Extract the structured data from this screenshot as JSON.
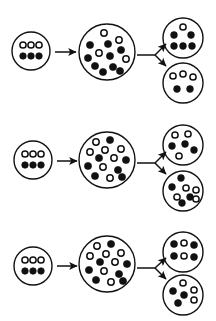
{
  "figure": {
    "name": "population-bottleneck-drift-diagram",
    "type": "diagram",
    "background_color": "#ffffff",
    "stroke_color": "#111111",
    "allele_types": {
      "filled": "filled-allele-dot",
      "open": "open-allele-dot"
    },
    "width": 216,
    "height": 321
  },
  "rows": [
    {
      "id": "row-1",
      "founder": {
        "name": "founder-population-row-1",
        "cx": 31,
        "cy": 51,
        "r": 19,
        "stroke_width": 1.4,
        "counts": {
          "filled": 3,
          "open": 3,
          "total": 6
        },
        "dots": [
          {
            "cx": 23,
            "cy": 45,
            "r": 3.1,
            "type": "open"
          },
          {
            "cx": 31,
            "cy": 45,
            "r": 3.1,
            "type": "open"
          },
          {
            "cx": 39,
            "cy": 45,
            "r": 3.1,
            "type": "open"
          },
          {
            "cx": 23,
            "cy": 56,
            "r": 3.3,
            "type": "filled"
          },
          {
            "cx": 31,
            "cy": 56,
            "r": 3.3,
            "type": "filled"
          },
          {
            "cx": 39,
            "cy": 56,
            "r": 3.3,
            "type": "filled"
          }
        ]
      },
      "grown": {
        "name": "grown-population-row-1",
        "cx": 107,
        "cy": 52,
        "r": 28,
        "stroke_width": 1.4,
        "counts": {
          "filled": 9,
          "open": 4,
          "total": 13
        },
        "dots": [
          {
            "cx": 104,
            "cy": 33,
            "r": 3.2,
            "type": "open"
          },
          {
            "cx": 119,
            "cy": 40,
            "r": 3.2,
            "type": "open"
          },
          {
            "cx": 90,
            "cy": 45,
            "r": 3.6,
            "type": "filled"
          },
          {
            "cx": 108,
            "cy": 44,
            "r": 3.6,
            "type": "filled"
          },
          {
            "cx": 121,
            "cy": 50,
            "r": 3.6,
            "type": "filled"
          },
          {
            "cx": 99,
            "cy": 53,
            "r": 3.2,
            "type": "open"
          },
          {
            "cx": 88,
            "cy": 58,
            "r": 3.6,
            "type": "filled"
          },
          {
            "cx": 110,
            "cy": 56,
            "r": 3.6,
            "type": "filled"
          },
          {
            "cx": 126,
            "cy": 59,
            "r": 3.2,
            "type": "open"
          },
          {
            "cx": 95,
            "cy": 66,
            "r": 3.6,
            "type": "filled"
          },
          {
            "cx": 113,
            "cy": 67,
            "r": 3.6,
            "type": "filled"
          },
          {
            "cx": 103,
            "cy": 72,
            "r": 3.6,
            "type": "filled"
          },
          {
            "cx": 120,
            "cy": 71,
            "r": 3.6,
            "type": "filled"
          }
        ]
      },
      "daughter_top": {
        "name": "daughter-population-row-1-top",
        "cx": 183,
        "cy": 38,
        "r": 20,
        "stroke_width": 1.4,
        "counts": {
          "filled": 5,
          "open": 1,
          "total": 6
        },
        "dots": [
          {
            "cx": 183,
            "cy": 27,
            "r": 3.1,
            "type": "open"
          },
          {
            "cx": 174,
            "cy": 35,
            "r": 3.4,
            "type": "filled"
          },
          {
            "cx": 191,
            "cy": 35,
            "r": 3.4,
            "type": "filled"
          },
          {
            "cx": 174,
            "cy": 46,
            "r": 3.4,
            "type": "filled"
          },
          {
            "cx": 183,
            "cy": 46,
            "r": 3.4,
            "type": "filled"
          },
          {
            "cx": 192,
            "cy": 46,
            "r": 3.4,
            "type": "filled"
          }
        ]
      },
      "daughter_bottom": {
        "name": "daughter-population-row-1-bottom",
        "cx": 183,
        "cy": 83,
        "r": 20,
        "stroke_width": 1.4,
        "counts": {
          "filled": 2,
          "open": 3,
          "total": 5
        },
        "dots": [
          {
            "cx": 173,
            "cy": 76,
            "r": 3.1,
            "type": "open"
          },
          {
            "cx": 183,
            "cy": 74,
            "r": 3.1,
            "type": "open"
          },
          {
            "cx": 193,
            "cy": 77,
            "r": 3.1,
            "type": "open"
          },
          {
            "cx": 177,
            "cy": 89,
            "r": 3.4,
            "type": "filled"
          },
          {
            "cx": 190,
            "cy": 89,
            "r": 3.4,
            "type": "filled"
          }
        ]
      },
      "arrow_main": {
        "name": "growth-arrow-row-1",
        "x1": 55,
        "y1": 52,
        "x2": 76,
        "y2": 52
      },
      "arrow_split": {
        "name": "split-arrows-row-1",
        "stem": {
          "x1": 137,
          "y1": 55,
          "x2": 155,
          "y2": 55
        },
        "branch_up": {
          "x1": 155,
          "y1": 55,
          "x2": 166,
          "y2": 44
        },
        "branch_down": {
          "x1": 155,
          "y1": 55,
          "x2": 166,
          "y2": 66
        }
      }
    },
    {
      "id": "row-2",
      "founder": {
        "name": "founder-population-row-2",
        "cx": 33,
        "cy": 160,
        "r": 19,
        "stroke_width": 1.4,
        "counts": {
          "filled": 3,
          "open": 3,
          "total": 6
        },
        "dots": [
          {
            "cx": 25,
            "cy": 154,
            "r": 3.1,
            "type": "open"
          },
          {
            "cx": 33,
            "cy": 154,
            "r": 3.1,
            "type": "open"
          },
          {
            "cx": 41,
            "cy": 154,
            "r": 3.1,
            "type": "open"
          },
          {
            "cx": 25,
            "cy": 165,
            "r": 3.3,
            "type": "filled"
          },
          {
            "cx": 33,
            "cy": 165,
            "r": 3.3,
            "type": "filled"
          },
          {
            "cx": 41,
            "cy": 165,
            "r": 3.3,
            "type": "filled"
          }
        ]
      },
      "grown": {
        "name": "grown-population-row-2",
        "cx": 107,
        "cy": 160,
        "r": 28,
        "stroke_width": 1.4,
        "counts": {
          "filled": 7,
          "open": 7,
          "total": 14
        },
        "dots": [
          {
            "cx": 96,
            "cy": 142,
            "r": 3.2,
            "type": "open"
          },
          {
            "cx": 110,
            "cy": 140,
            "r": 3.6,
            "type": "filled"
          },
          {
            "cx": 90,
            "cy": 152,
            "r": 3.2,
            "type": "open"
          },
          {
            "cx": 105,
            "cy": 150,
            "r": 3.2,
            "type": "open"
          },
          {
            "cx": 121,
            "cy": 149,
            "r": 3.2,
            "type": "open"
          },
          {
            "cx": 99,
            "cy": 158,
            "r": 3.6,
            "type": "filled"
          },
          {
            "cx": 114,
            "cy": 158,
            "r": 3.2,
            "type": "open"
          },
          {
            "cx": 126,
            "cy": 160,
            "r": 3.6,
            "type": "filled"
          },
          {
            "cx": 88,
            "cy": 166,
            "r": 3.6,
            "type": "filled"
          },
          {
            "cx": 103,
            "cy": 167,
            "r": 3.2,
            "type": "open"
          },
          {
            "cx": 118,
            "cy": 170,
            "r": 3.6,
            "type": "filled"
          },
          {
            "cx": 95,
            "cy": 176,
            "r": 3.6,
            "type": "filled"
          },
          {
            "cx": 110,
            "cy": 178,
            "r": 3.2,
            "type": "open"
          },
          {
            "cx": 122,
            "cy": 177,
            "r": 3.6,
            "type": "filled"
          }
        ]
      },
      "daughter_top": {
        "name": "daughter-population-row-2-top",
        "cx": 183,
        "cy": 145,
        "r": 20,
        "stroke_width": 1.4,
        "counts": {
          "filled": 3,
          "open": 3,
          "total": 6
        },
        "dots": [
          {
            "cx": 175,
            "cy": 135,
            "r": 3.1,
            "type": "open"
          },
          {
            "cx": 188,
            "cy": 134,
            "r": 3.1,
            "type": "open"
          },
          {
            "cx": 172,
            "cy": 146,
            "r": 3.4,
            "type": "filled"
          },
          {
            "cx": 185,
            "cy": 144,
            "r": 3.4,
            "type": "filled"
          },
          {
            "cx": 194,
            "cy": 150,
            "r": 3.4,
            "type": "filled"
          },
          {
            "cx": 179,
            "cy": 156,
            "r": 3.1,
            "type": "open"
          }
        ]
      },
      "daughter_bottom": {
        "name": "daughter-population-row-2-bottom",
        "cx": 183,
        "cy": 191,
        "r": 20,
        "stroke_width": 1.4,
        "counts": {
          "filled": 4,
          "open": 4,
          "total": 8
        },
        "dots": [
          {
            "cx": 181,
            "cy": 178,
            "r": 3.4,
            "type": "filled"
          },
          {
            "cx": 172,
            "cy": 187,
            "r": 3.4,
            "type": "filled"
          },
          {
            "cx": 186,
            "cy": 188,
            "r": 3.1,
            "type": "open"
          },
          {
            "cx": 196,
            "cy": 190,
            "r": 3.1,
            "type": "open"
          },
          {
            "cx": 177,
            "cy": 197,
            "r": 3.1,
            "type": "open"
          },
          {
            "cx": 190,
            "cy": 197,
            "r": 3.4,
            "type": "filled"
          },
          {
            "cx": 196,
            "cy": 199,
            "r": 3.1,
            "type": "open"
          },
          {
            "cx": 182,
            "cy": 203,
            "r": 3.4,
            "type": "filled"
          }
        ]
      },
      "arrow_main": {
        "name": "growth-arrow-row-2",
        "x1": 57,
        "y1": 161,
        "x2": 77,
        "y2": 161
      },
      "arrow_split": {
        "name": "split-arrows-row-2",
        "stem": {
          "x1": 137,
          "y1": 163,
          "x2": 155,
          "y2": 163
        },
        "branch_up": {
          "x1": 155,
          "y1": 163,
          "x2": 166,
          "y2": 152
        },
        "branch_down": {
          "x1": 155,
          "y1": 163,
          "x2": 166,
          "y2": 174
        }
      }
    },
    {
      "id": "row-3",
      "founder": {
        "name": "founder-population-row-3",
        "cx": 33,
        "cy": 266,
        "r": 19,
        "stroke_width": 1.4,
        "counts": {
          "filled": 3,
          "open": 3,
          "total": 6
        },
        "dots": [
          {
            "cx": 25,
            "cy": 260,
            "r": 3.1,
            "type": "open"
          },
          {
            "cx": 33,
            "cy": 260,
            "r": 3.1,
            "type": "open"
          },
          {
            "cx": 41,
            "cy": 260,
            "r": 3.1,
            "type": "open"
          },
          {
            "cx": 25,
            "cy": 271,
            "r": 3.3,
            "type": "filled"
          },
          {
            "cx": 33,
            "cy": 271,
            "r": 3.3,
            "type": "filled"
          },
          {
            "cx": 41,
            "cy": 271,
            "r": 3.3,
            "type": "filled"
          }
        ]
      },
      "grown": {
        "name": "grown-population-row-3",
        "cx": 107,
        "cy": 264,
        "r": 28,
        "stroke_width": 1.4,
        "counts": {
          "filled": 7,
          "open": 7,
          "total": 14
        },
        "dots": [
          {
            "cx": 97,
            "cy": 246,
            "r": 3.2,
            "type": "open"
          },
          {
            "cx": 111,
            "cy": 244,
            "r": 3.6,
            "type": "filled"
          },
          {
            "cx": 90,
            "cy": 256,
            "r": 3.2,
            "type": "open"
          },
          {
            "cx": 106,
            "cy": 254,
            "r": 3.2,
            "type": "open"
          },
          {
            "cx": 121,
            "cy": 253,
            "r": 3.2,
            "type": "open"
          },
          {
            "cx": 100,
            "cy": 262,
            "r": 3.6,
            "type": "filled"
          },
          {
            "cx": 115,
            "cy": 262,
            "r": 3.2,
            "type": "open"
          },
          {
            "cx": 127,
            "cy": 264,
            "r": 3.6,
            "type": "filled"
          },
          {
            "cx": 89,
            "cy": 270,
            "r": 3.6,
            "type": "filled"
          },
          {
            "cx": 104,
            "cy": 271,
            "r": 3.2,
            "type": "open"
          },
          {
            "cx": 119,
            "cy": 274,
            "r": 3.6,
            "type": "filled"
          },
          {
            "cx": 96,
            "cy": 280,
            "r": 3.6,
            "type": "filled"
          },
          {
            "cx": 111,
            "cy": 282,
            "r": 3.2,
            "type": "open"
          },
          {
            "cx": 123,
            "cy": 281,
            "r": 3.6,
            "type": "filled"
          }
        ]
      },
      "daughter_top": {
        "name": "daughter-population-row-3-top",
        "cx": 183,
        "cy": 252,
        "r": 20,
        "stroke_width": 1.4,
        "counts": {
          "filled": 4,
          "open": 2,
          "total": 6
        },
        "dots": [
          {
            "cx": 174,
            "cy": 244,
            "r": 3.5,
            "type": "filled"
          },
          {
            "cx": 184,
            "cy": 243,
            "r": 3.1,
            "type": "open"
          },
          {
            "cx": 194,
            "cy": 245,
            "r": 3.5,
            "type": "filled"
          },
          {
            "cx": 174,
            "cy": 256,
            "r": 3.5,
            "type": "filled"
          },
          {
            "cx": 184,
            "cy": 256,
            "r": 3.1,
            "type": "open"
          },
          {
            "cx": 194,
            "cy": 257,
            "r": 3.5,
            "type": "filled"
          }
        ]
      },
      "daughter_bottom": {
        "name": "daughter-population-row-3-bottom",
        "cx": 183,
        "cy": 295,
        "r": 20,
        "stroke_width": 1.4,
        "counts": {
          "filled": 3,
          "open": 3,
          "total": 6
        },
        "dots": [
          {
            "cx": 183,
            "cy": 283,
            "r": 3.1,
            "type": "open"
          },
          {
            "cx": 173,
            "cy": 291,
            "r": 3.5,
            "type": "filled"
          },
          {
            "cx": 194,
            "cy": 290,
            "r": 3.1,
            "type": "open"
          },
          {
            "cx": 184,
            "cy": 295,
            "r": 3.5,
            "type": "filled"
          },
          {
            "cx": 194,
            "cy": 300,
            "r": 3.1,
            "type": "open"
          },
          {
            "cx": 178,
            "cy": 303,
            "r": 3.5,
            "type": "filled"
          }
        ]
      },
      "arrow_main": {
        "name": "growth-arrow-row-3",
        "x1": 57,
        "y1": 266,
        "x2": 77,
        "y2": 266
      },
      "arrow_split": {
        "name": "split-arrows-row-3",
        "stem": {
          "x1": 137,
          "y1": 268,
          "x2": 155,
          "y2": 268
        },
        "branch_up": {
          "x1": 155,
          "y1": 268,
          "x2": 166,
          "y2": 258
        },
        "branch_down": {
          "x1": 155,
          "y1": 268,
          "x2": 166,
          "y2": 279
        }
      }
    }
  ]
}
